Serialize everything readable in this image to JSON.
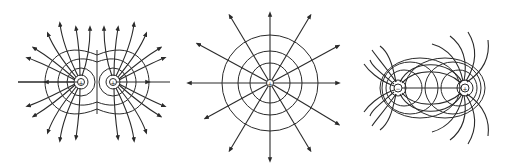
{
  "figure": {
    "panels": [
      {
        "id": "like-charges",
        "description": "Field lines and equipotentials of two equal positive charges",
        "charges": [
          {
            "sign": "+",
            "label": "+"
          },
          {
            "sign": "+",
            "label": "+"
          }
        ]
      },
      {
        "id": "single-charge",
        "description": "Radial field lines and circular equipotentials of a single positive charge",
        "charges": [
          {
            "sign": "+",
            "label": "+"
          }
        ]
      },
      {
        "id": "dipole",
        "description": "Field lines and equipotentials of an electric dipole",
        "charges": [
          {
            "sign": "-",
            "label": "−"
          },
          {
            "sign": "+",
            "label": "+"
          }
        ]
      }
    ],
    "colors": {
      "line": "#2a2a2a",
      "background": "#ffffff"
    }
  }
}
